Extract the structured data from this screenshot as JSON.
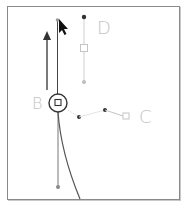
{
  "diagram": {
    "type": "bezier-path-anchor-illustration",
    "labels": {
      "b": "B",
      "c": "C",
      "d": "D"
    },
    "colors": {
      "frame_border": "#8a8a8a",
      "path_stroke": "#555555",
      "handle_line": "#c8c8c8",
      "label_text": "#c4c4c4",
      "anchor_dot": "#333333"
    },
    "points": {
      "B": {
        "anchor": [
          58,
          103
        ],
        "selected": true,
        "handle_up": [
          57,
          19
        ],
        "handle_down": [
          58,
          187
        ]
      },
      "C": {
        "anchor": [
          126,
          116
        ],
        "handles": [
          [
            105,
            110
          ],
          [
            79,
            117
          ]
        ]
      },
      "D": {
        "anchor": [
          84,
          48
        ],
        "handles": [
          [
            84,
            17
          ],
          [
            84,
            82
          ]
        ]
      }
    },
    "cursor": "arrow-pointer",
    "direction_arrow": "up"
  }
}
